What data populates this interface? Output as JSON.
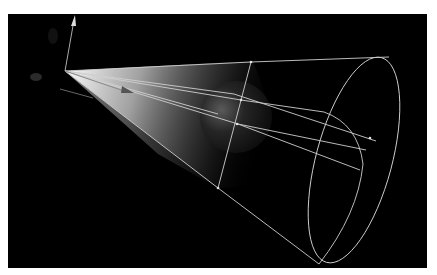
{
  "caption": "",
  "viewport": {
    "background": "#000000",
    "subject": "spotlight cone illuminating a sphere",
    "wire_color": "#cfcfcf",
    "light_color": "#ffffff"
  }
}
